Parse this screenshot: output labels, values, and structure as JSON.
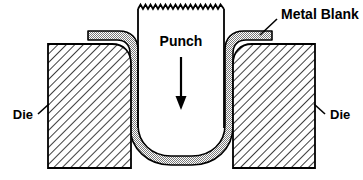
{
  "diagram": {
    "labels": {
      "punch": "Punch",
      "metal_blank": "Metal Blank",
      "die_left": "Die",
      "die_right": "Die"
    },
    "colors": {
      "outline": "#000000",
      "background": "#ffffff",
      "blank_fill": "#b3b3b3",
      "die_hatch": "#000000",
      "punch_fill": "#ffffff",
      "arrow": "#000000"
    },
    "components": [
      {
        "name": "punch",
        "label": "Punch",
        "fill": "open",
        "top_edge": "sawtooth-break-line",
        "description": "Vertical punch tool descending into the die cavity"
      },
      {
        "name": "metal-blank",
        "label": "Metal Blank",
        "fill": "stipple-gray",
        "description": "Sheet metal blank drawn into a U-shaped cup between punch and die"
      },
      {
        "name": "die-left",
        "label": "Die",
        "fill": "diagonal-hatch",
        "description": "Left die block section"
      },
      {
        "name": "die-right",
        "label": "Die",
        "fill": "diagonal-hatch",
        "description": "Right die block section"
      }
    ],
    "annotations": [
      {
        "name": "punch-direction-arrow",
        "direction": "down",
        "meaning": "punch travel direction"
      },
      {
        "name": "metal-blank-leader",
        "from": "Metal Blank",
        "to": "blank flange upper right"
      },
      {
        "name": "die-left-leader",
        "from": "Die",
        "to": "left die block"
      },
      {
        "name": "die-right-leader",
        "from": "Die",
        "to": "right die block"
      }
    ]
  }
}
